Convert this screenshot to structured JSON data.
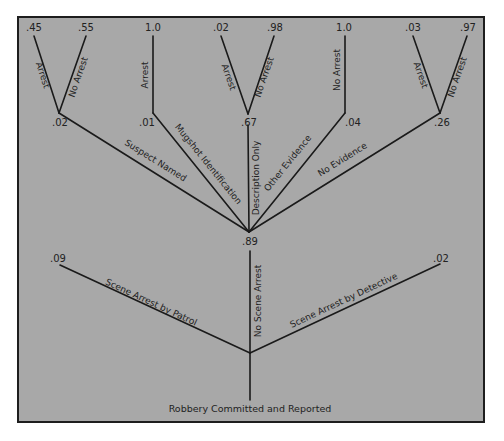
{
  "diagram": {
    "type": "probability-tree",
    "colors": {
      "background": "#a8a8a8",
      "border": "#1e1e1e",
      "line": "#1a1a1a",
      "text": "#222222"
    },
    "root": {
      "label": "Robbery Committed and Reported"
    },
    "level1": {
      "scene_patrol": {
        "edge_label": "Scene Arrest by Patrol",
        "prob": ".09"
      },
      "no_scene": {
        "edge_label": "No Scene Arrest",
        "prob": ".89"
      },
      "scene_detective": {
        "edge_label": "Scene Arrest by Detective",
        "prob": ".02"
      }
    },
    "level2": {
      "suspect_named": {
        "edge_label": "Suspect Named",
        "prob": ".02"
      },
      "mugshot": {
        "edge_label": "Mugshot Identification",
        "prob": ".01"
      },
      "description_only": {
        "edge_label": "Description Only",
        "prob": ".67"
      },
      "other_evidence": {
        "edge_label": "Other Evidence",
        "prob": ".04"
      },
      "no_evidence": {
        "edge_label": "No Evidence",
        "prob": ".26"
      }
    },
    "level3": {
      "suspect_named": {
        "arrest": {
          "edge_label": "Arrest",
          "prob": ".45"
        },
        "no_arrest": {
          "edge_label": "No Arrest",
          "prob": ".55"
        }
      },
      "mugshot": {
        "arrest": {
          "edge_label": "Arrest",
          "prob": "1.0"
        }
      },
      "description_only": {
        "arrest": {
          "edge_label": "Arrest",
          "prob": ".02"
        },
        "no_arrest": {
          "edge_label": "No Arrest",
          "prob": ".98"
        }
      },
      "other_evidence": {
        "no_arrest": {
          "edge_label": "No Arrest",
          "prob": "1.0"
        }
      },
      "no_evidence": {
        "arrest": {
          "edge_label": "Arrest",
          "prob": ".03"
        },
        "no_arrest": {
          "edge_label": "No Arrest",
          "prob": ".97"
        }
      }
    }
  }
}
